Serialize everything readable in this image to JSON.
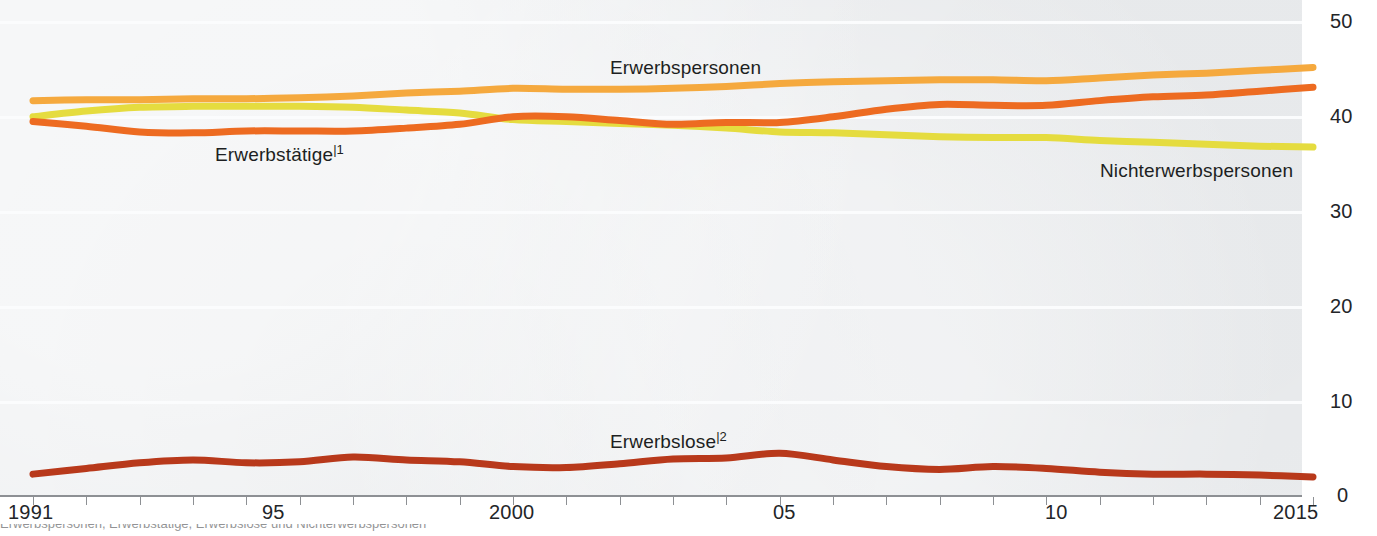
{
  "chart_data": {
    "type": "line",
    "title": "",
    "subtitle": "",
    "xlabel": "",
    "ylabel": "",
    "unit_note": "Millionen",
    "x": [
      1991,
      1992,
      1993,
      1994,
      1995,
      1996,
      1997,
      1998,
      1999,
      2000,
      2001,
      2002,
      2003,
      2004,
      2005,
      2006,
      2007,
      2008,
      2009,
      2010,
      2011,
      2012,
      2013,
      2014,
      2015
    ],
    "xlim": [
      1991,
      2015
    ],
    "ylim": [
      0,
      50
    ],
    "yticks": [
      0,
      10,
      20,
      30,
      40,
      50
    ],
    "xticks_labeled": [
      {
        "x": 1991,
        "label": "1991"
      },
      {
        "x": 1995,
        "label": "95"
      },
      {
        "x": 2000,
        "label": "2000"
      },
      {
        "x": 2005,
        "label": "05"
      },
      {
        "x": 2010,
        "label": "10"
      },
      {
        "x": 2015,
        "label": "2015"
      }
    ],
    "grid": true,
    "grid_axis": "y",
    "legend_position": "inline-labels",
    "series": [
      {
        "name": "Erwerbspersonen",
        "color": "#F5A93E",
        "label_x": 2000,
        "values": [
          41.6,
          41.7,
          41.7,
          41.8,
          41.8,
          41.9,
          42.1,
          42.4,
          42.6,
          42.9,
          42.8,
          42.8,
          42.9,
          43.1,
          43.4,
          43.6,
          43.7,
          43.8,
          43.8,
          43.7,
          44.0,
          44.3,
          44.5,
          44.8,
          45.1
        ]
      },
      {
        "name": "Erwerbstätige",
        "footnote": "1",
        "color": "#ED6B21",
        "label_x": 1996,
        "values": [
          39.4,
          38.9,
          38.3,
          38.2,
          38.4,
          38.4,
          38.4,
          38.7,
          39.1,
          39.9,
          39.9,
          39.5,
          39.1,
          39.3,
          39.3,
          39.9,
          40.7,
          41.2,
          41.1,
          41.1,
          41.6,
          42.0,
          42.2,
          42.6,
          43.0
        ]
      },
      {
        "name": "Nichterwerbspersonen",
        "color": "#E5DC3F",
        "label_x": 2010,
        "values": [
          39.9,
          40.5,
          40.9,
          41.0,
          41.0,
          41.0,
          40.9,
          40.6,
          40.3,
          39.6,
          39.4,
          39.2,
          39.0,
          38.7,
          38.3,
          38.2,
          38.0,
          37.8,
          37.7,
          37.7,
          37.4,
          37.2,
          37.0,
          36.8,
          36.7
        ]
      },
      {
        "name": "Erwerbslose",
        "footnote": "2",
        "color": "#B8391B",
        "label_x": 2000,
        "values": [
          2.2,
          2.8,
          3.4,
          3.7,
          3.4,
          3.5,
          4.0,
          3.7,
          3.5,
          3.0,
          2.9,
          3.3,
          3.8,
          3.9,
          4.4,
          3.7,
          3.0,
          2.7,
          3.0,
          2.8,
          2.4,
          2.2,
          2.2,
          2.1,
          1.9
        ]
      }
    ]
  },
  "axes": {
    "y_tick_labels": [
      "50",
      "40",
      "30",
      "20",
      "10",
      "0"
    ],
    "x_tick_labels": [
      "1991",
      "95",
      "2000",
      "05",
      "10",
      "2015"
    ]
  },
  "labels": {
    "erwerbspersonen": "Erwerbspersonen",
    "erwerbstaetige": "Erwerbstätige",
    "erwerbstaetige_footnote": "|1",
    "nichterwerbspersonen": "Nichterwerbspersonen",
    "erwerbslose": "Erwerbslose",
    "erwerbslose_footnote": "|2"
  },
  "colors": {
    "erwerbspersonen": "#F5A93E",
    "erwerbstaetige": "#ED6B21",
    "nichterwerbspersonen": "#E5DC3F",
    "erwerbslose": "#B8391B",
    "panel_background": "#eceef0",
    "gridline": "#fbfcfd",
    "axis": "#8d9094",
    "text": "#232528"
  },
  "footnote_strip": "Erwerbspersonen, Erwerbstätige, Erwerbslose und Nichterwerbspersonen"
}
